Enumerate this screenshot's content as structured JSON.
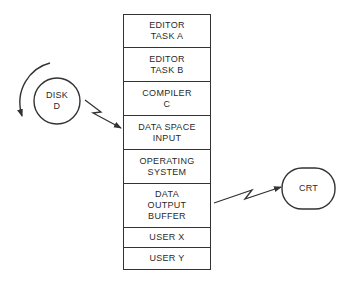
{
  "memory_stack": {
    "segments": [
      {
        "label": "EDITOR\nTASK A",
        "height": 33
      },
      {
        "label": "EDITOR\nTASK B",
        "height": 34
      },
      {
        "label": "COMPILER\nC",
        "height": 34
      },
      {
        "label": "DATA SPACE\nINPUT",
        "height": 34
      },
      {
        "label": "OPERATING\nSYSTEM",
        "height": 34
      },
      {
        "label": "DATA\nOUTPUT\nBUFFER",
        "height": 44
      },
      {
        "label": "USER X",
        "height": 20
      },
      {
        "label": "USER Y",
        "height": 21
      }
    ]
  },
  "disk": {
    "label": "DISK\nD"
  },
  "crt": {
    "label": "CRT"
  },
  "connections": [
    {
      "from": "disk",
      "to": "DATA SPACE INPUT"
    },
    {
      "from": "DATA OUTPUT BUFFER",
      "to": "crt"
    }
  ]
}
